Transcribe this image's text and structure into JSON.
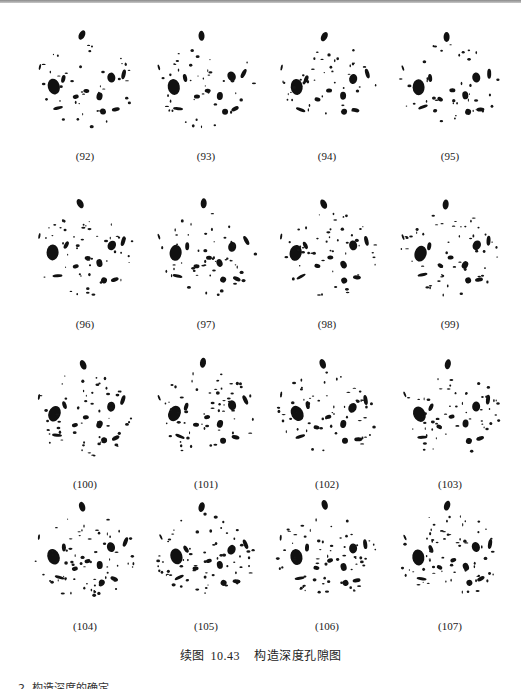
{
  "figure": {
    "panels": [
      {
        "label": "(92)"
      },
      {
        "label": "(93)"
      },
      {
        "label": "(94)"
      },
      {
        "label": "(95)"
      },
      {
        "label": "(96)"
      },
      {
        "label": "(97)"
      },
      {
        "label": "(98)"
      },
      {
        "label": "(99)"
      },
      {
        "label": "(100)"
      },
      {
        "label": "(101)"
      },
      {
        "label": "(102)"
      },
      {
        "label": "(103)"
      },
      {
        "label": "(104)"
      },
      {
        "label": "(105)"
      },
      {
        "label": "(106)"
      },
      {
        "label": "(107)"
      }
    ],
    "caption": {
      "prefix": "续图",
      "number": "10.43",
      "title": "构造深度孔隙图"
    }
  },
  "bottom_text": "2. 构造深度的确定"
}
